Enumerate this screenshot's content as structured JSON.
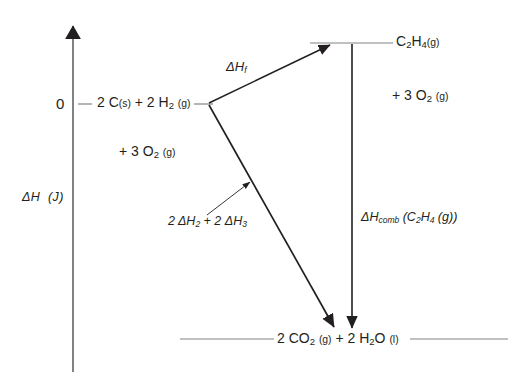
{
  "diagram": {
    "kind": "enthalpy-level-diagram",
    "background_color": "#ffffff",
    "line_color": "#231f20",
    "axis_color": "#808285",
    "axis": {
      "label_prefix": "ΔH",
      "label_units": "(J)",
      "zero_tick": "0",
      "arrow_direction": "up"
    },
    "levels": {
      "zero": {
        "value": "0",
        "species": "2 C",
        "species_phase": "(s)",
        "plus": "+ 2 H",
        "plus_sub": "2",
        "plus_phase": "(g)",
        "extra_prefix": "+ 3 O",
        "extra_sub": "2",
        "extra_phase": "(g)"
      },
      "top": {
        "species_prefix": "C",
        "species_sub1": "2",
        "species_mid": "H",
        "species_sub2": "4",
        "species_phase": "(g)",
        "extra_prefix": "+ 3 O",
        "extra_sub": "2",
        "extra_phase": "(g)"
      },
      "bottom": {
        "part1_prefix": "2 CO",
        "part1_sub": "2",
        "part1_phase": "(g)",
        "part2_prefix": "+ 2 H",
        "part2_sub": "2",
        "part2_mid": "O",
        "part2_phase": "(l)"
      }
    },
    "arrows": {
      "formation": {
        "label_prefix": "ΔH",
        "label_sub": "f"
      },
      "combustion": {
        "label_prefix": "ΔH",
        "label_sub": "comb",
        "label_suffix_open": " (C",
        "label_suffix_sub1": "2",
        "label_suffix_mid": "H",
        "label_suffix_sub2": "4",
        "label_suffix_phase": " (g))"
      },
      "multistep": {
        "label_prefix": "2 ΔH",
        "label_sub1": "2",
        "label_mid": " + 2 ΔH",
        "label_sub2": "3"
      }
    }
  }
}
